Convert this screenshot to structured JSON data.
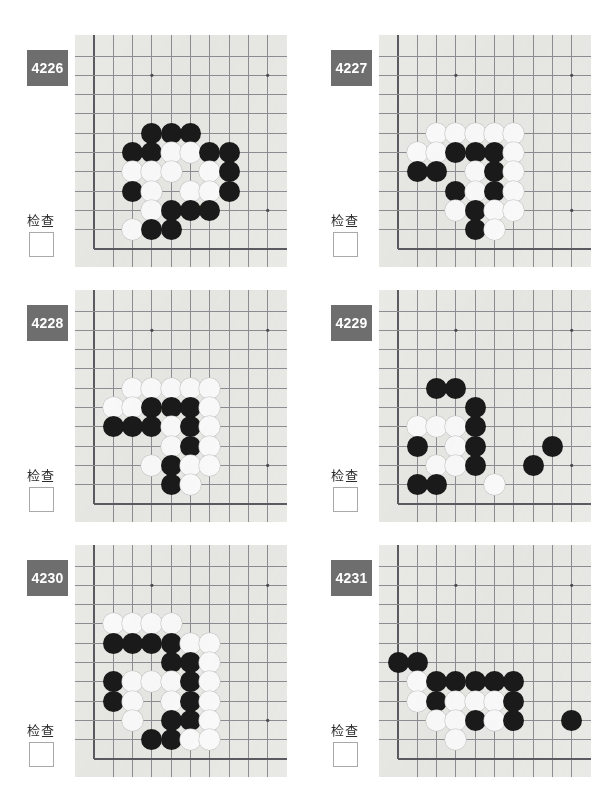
{
  "page": {
    "columns": 2,
    "rows": 3
  },
  "common": {
    "check_label": "检查",
    "badge_color": "#6e6e6e",
    "badge_text_color": "#ffffff",
    "board_color": "#e9e9e6",
    "black_stone_color": "#1a1a1a",
    "white_stone_color": "#fbfbfb",
    "grid_line_color": "#8d8d92"
  },
  "board_geometry": {
    "cols": 11,
    "rows": 11,
    "cell": 19.3,
    "origin_x": 19,
    "origin_y": 21,
    "stone_diameter": 21,
    "hoshi": [
      [
        4,
        2
      ],
      [
        10,
        2
      ],
      [
        10,
        9
      ]
    ],
    "left_edge_col": 1,
    "bottom_edge_row": 11
  },
  "puzzles": [
    {
      "id": "4226",
      "label": "4226",
      "check_label": "检查",
      "stones": [
        {
          "c": 4,
          "r": 5,
          "color": "black"
        },
        {
          "c": 5,
          "r": 5,
          "color": "black"
        },
        {
          "c": 6,
          "r": 5,
          "color": "black"
        },
        {
          "c": 3,
          "r": 6,
          "color": "black"
        },
        {
          "c": 4,
          "r": 6,
          "color": "black"
        },
        {
          "c": 5,
          "r": 6,
          "color": "white"
        },
        {
          "c": 6,
          "r": 6,
          "color": "white"
        },
        {
          "c": 7,
          "r": 6,
          "color": "black"
        },
        {
          "c": 8,
          "r": 6,
          "color": "black"
        },
        {
          "c": 3,
          "r": 7,
          "color": "white"
        },
        {
          "c": 4,
          "r": 7,
          "color": "white"
        },
        {
          "c": 5,
          "r": 7,
          "color": "white"
        },
        {
          "c": 7,
          "r": 7,
          "color": "white"
        },
        {
          "c": 8,
          "r": 7,
          "color": "black"
        },
        {
          "c": 3,
          "r": 8,
          "color": "black"
        },
        {
          "c": 4,
          "r": 8,
          "color": "white"
        },
        {
          "c": 6,
          "r": 8,
          "color": "white"
        },
        {
          "c": 7,
          "r": 8,
          "color": "white"
        },
        {
          "c": 8,
          "r": 8,
          "color": "black"
        },
        {
          "c": 4,
          "r": 9,
          "color": "white"
        },
        {
          "c": 5,
          "r": 9,
          "color": "black"
        },
        {
          "c": 6,
          "r": 9,
          "color": "black"
        },
        {
          "c": 7,
          "r": 9,
          "color": "black"
        },
        {
          "c": 3,
          "r": 10,
          "color": "white"
        },
        {
          "c": 4,
          "r": 10,
          "color": "black"
        },
        {
          "c": 5,
          "r": 10,
          "color": "black"
        }
      ]
    },
    {
      "id": "4227",
      "label": "4227",
      "check_label": "检查",
      "stones": [
        {
          "c": 3,
          "r": 5,
          "color": "white"
        },
        {
          "c": 4,
          "r": 5,
          "color": "white"
        },
        {
          "c": 5,
          "r": 5,
          "color": "white"
        },
        {
          "c": 6,
          "r": 5,
          "color": "white"
        },
        {
          "c": 7,
          "r": 5,
          "color": "white"
        },
        {
          "c": 2,
          "r": 6,
          "color": "white"
        },
        {
          "c": 3,
          "r": 6,
          "color": "white"
        },
        {
          "c": 4,
          "r": 6,
          "color": "black"
        },
        {
          "c": 5,
          "r": 6,
          "color": "black"
        },
        {
          "c": 6,
          "r": 6,
          "color": "black"
        },
        {
          "c": 7,
          "r": 6,
          "color": "white"
        },
        {
          "c": 2,
          "r": 7,
          "color": "black"
        },
        {
          "c": 3,
          "r": 7,
          "color": "black"
        },
        {
          "c": 5,
          "r": 7,
          "color": "white"
        },
        {
          "c": 6,
          "r": 7,
          "color": "black"
        },
        {
          "c": 7,
          "r": 7,
          "color": "white"
        },
        {
          "c": 4,
          "r": 8,
          "color": "black"
        },
        {
          "c": 5,
          "r": 8,
          "color": "white"
        },
        {
          "c": 6,
          "r": 8,
          "color": "black"
        },
        {
          "c": 7,
          "r": 8,
          "color": "white"
        },
        {
          "c": 4,
          "r": 9,
          "color": "white"
        },
        {
          "c": 5,
          "r": 9,
          "color": "black"
        },
        {
          "c": 6,
          "r": 9,
          "color": "white"
        },
        {
          "c": 7,
          "r": 9,
          "color": "white"
        },
        {
          "c": 5,
          "r": 10,
          "color": "black"
        },
        {
          "c": 6,
          "r": 10,
          "color": "white"
        }
      ]
    },
    {
      "id": "4228",
      "label": "4228",
      "check_label": "检查",
      "stones": [
        {
          "c": 3,
          "r": 5,
          "color": "white"
        },
        {
          "c": 4,
          "r": 5,
          "color": "white"
        },
        {
          "c": 5,
          "r": 5,
          "color": "white"
        },
        {
          "c": 6,
          "r": 5,
          "color": "white"
        },
        {
          "c": 7,
          "r": 5,
          "color": "white"
        },
        {
          "c": 2,
          "r": 6,
          "color": "white"
        },
        {
          "c": 3,
          "r": 6,
          "color": "white"
        },
        {
          "c": 4,
          "r": 6,
          "color": "black"
        },
        {
          "c": 5,
          "r": 6,
          "color": "black"
        },
        {
          "c": 6,
          "r": 6,
          "color": "black"
        },
        {
          "c": 7,
          "r": 6,
          "color": "white"
        },
        {
          "c": 2,
          "r": 7,
          "color": "black"
        },
        {
          "c": 3,
          "r": 7,
          "color": "black"
        },
        {
          "c": 4,
          "r": 7,
          "color": "black"
        },
        {
          "c": 5,
          "r": 7,
          "color": "white"
        },
        {
          "c": 6,
          "r": 7,
          "color": "black"
        },
        {
          "c": 7,
          "r": 7,
          "color": "white"
        },
        {
          "c": 5,
          "r": 8,
          "color": "white"
        },
        {
          "c": 6,
          "r": 8,
          "color": "black"
        },
        {
          "c": 7,
          "r": 8,
          "color": "white"
        },
        {
          "c": 4,
          "r": 9,
          "color": "white"
        },
        {
          "c": 5,
          "r": 9,
          "color": "black"
        },
        {
          "c": 6,
          "r": 9,
          "color": "white"
        },
        {
          "c": 7,
          "r": 9,
          "color": "white"
        },
        {
          "c": 5,
          "r": 10,
          "color": "black"
        },
        {
          "c": 6,
          "r": 10,
          "color": "white"
        }
      ]
    },
    {
      "id": "4229",
      "label": "4229",
      "check_label": "检查",
      "stones": [
        {
          "c": 3,
          "r": 5,
          "color": "black"
        },
        {
          "c": 4,
          "r": 5,
          "color": "black"
        },
        {
          "c": 5,
          "r": 6,
          "color": "black"
        },
        {
          "c": 2,
          "r": 7,
          "color": "white"
        },
        {
          "c": 3,
          "r": 7,
          "color": "white"
        },
        {
          "c": 4,
          "r": 7,
          "color": "white"
        },
        {
          "c": 5,
          "r": 7,
          "color": "black"
        },
        {
          "c": 2,
          "r": 8,
          "color": "black"
        },
        {
          "c": 4,
          "r": 8,
          "color": "white"
        },
        {
          "c": 5,
          "r": 8,
          "color": "black"
        },
        {
          "c": 9,
          "r": 8,
          "color": "black"
        },
        {
          "c": 3,
          "r": 9,
          "color": "white"
        },
        {
          "c": 4,
          "r": 9,
          "color": "white"
        },
        {
          "c": 5,
          "r": 9,
          "color": "black"
        },
        {
          "c": 8,
          "r": 9,
          "color": "black"
        },
        {
          "c": 2,
          "r": 10,
          "color": "black"
        },
        {
          "c": 3,
          "r": 10,
          "color": "black"
        },
        {
          "c": 6,
          "r": 10,
          "color": "white"
        }
      ]
    },
    {
      "id": "4230",
      "label": "4230",
      "check_label": "检查",
      "stones": [
        {
          "c": 2,
          "r": 4,
          "color": "white"
        },
        {
          "c": 3,
          "r": 4,
          "color": "white"
        },
        {
          "c": 4,
          "r": 4,
          "color": "white"
        },
        {
          "c": 5,
          "r": 4,
          "color": "white"
        },
        {
          "c": 2,
          "r": 5,
          "color": "black"
        },
        {
          "c": 3,
          "r": 5,
          "color": "black"
        },
        {
          "c": 4,
          "r": 5,
          "color": "black"
        },
        {
          "c": 5,
          "r": 5,
          "color": "black"
        },
        {
          "c": 6,
          "r": 5,
          "color": "white"
        },
        {
          "c": 7,
          "r": 5,
          "color": "white"
        },
        {
          "c": 5,
          "r": 6,
          "color": "black"
        },
        {
          "c": 6,
          "r": 6,
          "color": "black"
        },
        {
          "c": 7,
          "r": 6,
          "color": "white"
        },
        {
          "c": 2,
          "r": 7,
          "color": "black"
        },
        {
          "c": 3,
          "r": 7,
          "color": "white"
        },
        {
          "c": 4,
          "r": 7,
          "color": "white"
        },
        {
          "c": 5,
          "r": 7,
          "color": "white"
        },
        {
          "c": 6,
          "r": 7,
          "color": "black"
        },
        {
          "c": 7,
          "r": 7,
          "color": "white"
        },
        {
          "c": 2,
          "r": 8,
          "color": "black"
        },
        {
          "c": 3,
          "r": 8,
          "color": "white"
        },
        {
          "c": 5,
          "r": 8,
          "color": "white"
        },
        {
          "c": 6,
          "r": 8,
          "color": "black"
        },
        {
          "c": 7,
          "r": 8,
          "color": "white"
        },
        {
          "c": 3,
          "r": 9,
          "color": "white"
        },
        {
          "c": 5,
          "r": 9,
          "color": "black"
        },
        {
          "c": 6,
          "r": 9,
          "color": "black"
        },
        {
          "c": 7,
          "r": 9,
          "color": "white"
        },
        {
          "c": 4,
          "r": 10,
          "color": "black"
        },
        {
          "c": 5,
          "r": 10,
          "color": "black"
        },
        {
          "c": 6,
          "r": 10,
          "color": "white"
        },
        {
          "c": 7,
          "r": 10,
          "color": "white"
        }
      ]
    },
    {
      "id": "4231",
      "label": "4231",
      "check_label": "检查",
      "stones": [
        {
          "c": 1,
          "r": 6,
          "color": "black"
        },
        {
          "c": 2,
          "r": 6,
          "color": "black"
        },
        {
          "c": 2,
          "r": 7,
          "color": "white"
        },
        {
          "c": 3,
          "r": 7,
          "color": "black"
        },
        {
          "c": 4,
          "r": 7,
          "color": "black"
        },
        {
          "c": 5,
          "r": 7,
          "color": "black"
        },
        {
          "c": 6,
          "r": 7,
          "color": "black"
        },
        {
          "c": 7,
          "r": 7,
          "color": "black"
        },
        {
          "c": 2,
          "r": 8,
          "color": "white"
        },
        {
          "c": 3,
          "r": 8,
          "color": "black"
        },
        {
          "c": 4,
          "r": 8,
          "color": "white"
        },
        {
          "c": 5,
          "r": 8,
          "color": "white"
        },
        {
          "c": 6,
          "r": 8,
          "color": "white"
        },
        {
          "c": 7,
          "r": 8,
          "color": "black"
        },
        {
          "c": 3,
          "r": 9,
          "color": "white"
        },
        {
          "c": 4,
          "r": 9,
          "color": "white"
        },
        {
          "c": 5,
          "r": 9,
          "color": "black"
        },
        {
          "c": 6,
          "r": 9,
          "color": "white"
        },
        {
          "c": 7,
          "r": 9,
          "color": "black"
        },
        {
          "c": 10,
          "r": 9,
          "color": "black"
        },
        {
          "c": 4,
          "r": 10,
          "color": "white"
        }
      ]
    }
  ]
}
